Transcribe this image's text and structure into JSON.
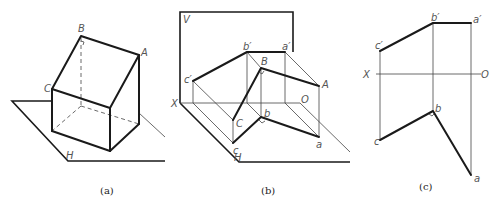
{
  "figure": {
    "panels": [
      {
        "id": "a",
        "caption": "(a)",
        "labels": {
          "B": "B",
          "A": "A",
          "C": "C",
          "H": "H"
        }
      },
      {
        "id": "b",
        "caption": "(b)",
        "labels": {
          "V": "V",
          "X": "X",
          "O": "O",
          "H": "H",
          "b_prime": "b′",
          "a_prime": "a′",
          "c_prime": "c′",
          "B": "B",
          "A": "A",
          "C": "C",
          "b": "b",
          "a": "a",
          "c": "c"
        }
      },
      {
        "id": "c",
        "caption": "(c)",
        "labels": {
          "b_prime": "b′",
          "a_prime": "a′",
          "c_prime": "c′",
          "X": "X",
          "O": "O",
          "b": "b",
          "c": "c",
          "a": "a"
        }
      }
    ]
  }
}
